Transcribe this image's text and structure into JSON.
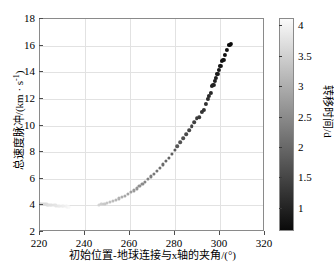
{
  "chart_data": {
    "type": "scatter",
    "title": "",
    "xlabel": "初始位置-地球连接与x轴的夹角/(°)",
    "ylabel": "总速度脉冲/(km·s⁻¹)",
    "xlim": [
      220,
      320
    ],
    "ylim": [
      2,
      18
    ],
    "xticks": [
      220,
      240,
      260,
      280,
      300,
      320
    ],
    "xticklabels": [
      "220",
      "240",
      "260",
      "280",
      "300",
      "320"
    ],
    "yticks": [
      2,
      4,
      6,
      8,
      10,
      12,
      14,
      16,
      18
    ],
    "yticklabels": [
      "2",
      "4",
      "6",
      "8",
      "10",
      "12",
      "14",
      "16",
      "18"
    ],
    "grid": true,
    "legend": null,
    "colorbar": {
      "label": "转移时间/d",
      "ticks": [
        1,
        1.5,
        2,
        2.5,
        3,
        3.5,
        4
      ],
      "ticklabels": [
        "1",
        "1.5",
        "2",
        "2.5",
        "3",
        "3.5",
        "4"
      ],
      "vmin": 0.62,
      "vmax": 4.12,
      "colormap": "gray",
      "low_color": "#0a0a0a",
      "high_color": "#fafafa"
    },
    "marker": "filled-circle",
    "colorvar": "转移时间/d",
    "series": [
      {
        "name": "左支 (220°-233°)",
        "x": [
          220.0,
          220.6,
          221.2,
          221.8,
          222.4,
          223.0,
          223.6,
          224.2,
          224.8,
          225.4,
          226.0,
          226.6,
          227.2,
          227.8,
          228.4,
          229.0,
          229.6,
          230.2,
          230.8,
          231.4,
          232.0,
          232.6,
          233.0
        ],
        "y": [
          4.12,
          4.11,
          4.1,
          4.09,
          4.08,
          4.07,
          4.06,
          4.05,
          4.04,
          4.03,
          4.02,
          4.01,
          4.0,
          3.99,
          3.98,
          3.97,
          3.96,
          3.95,
          3.94,
          3.93,
          3.92,
          3.91,
          3.9
        ],
        "c": [
          3.58,
          3.6,
          3.62,
          3.64,
          3.66,
          3.68,
          3.7,
          3.72,
          3.74,
          3.76,
          3.78,
          3.8,
          3.82,
          3.84,
          3.86,
          3.88,
          3.9,
          3.92,
          3.95,
          3.98,
          4.01,
          4.05,
          4.1
        ]
      },
      {
        "name": "右支 (246°-305°)",
        "x": [
          246.0,
          247.3,
          248.6,
          249.9,
          251.2,
          252.5,
          253.8,
          255.1,
          256.4,
          257.7,
          259.0,
          260.3,
          261.6,
          262.9,
          264.2,
          265.5,
          266.8,
          268.1,
          269.4,
          270.7,
          272.0,
          273.3,
          274.6,
          275.9,
          277.2,
          278.5,
          279.8,
          281.1,
          282.4,
          283.7,
          285.0,
          286.2,
          287.4,
          288.6,
          289.7,
          290.8,
          291.8,
          292.8,
          293.7,
          294.5,
          295.2,
          295.9,
          296.5,
          297.1,
          297.6,
          298.1,
          298.6,
          299.1,
          299.6,
          300.2,
          300.8,
          301.5,
          302.3,
          303.2,
          304.2,
          305.0
        ],
        "y": [
          4.05,
          4.09,
          4.14,
          4.2,
          4.27,
          4.35,
          4.44,
          4.53,
          4.63,
          4.74,
          4.86,
          4.99,
          5.13,
          5.28,
          5.44,
          5.61,
          5.79,
          5.98,
          6.18,
          6.39,
          6.61,
          6.84,
          7.08,
          7.33,
          7.59,
          7.86,
          8.14,
          8.43,
          8.73,
          9.04,
          9.36,
          9.66,
          9.96,
          10.25,
          10.55,
          10.62,
          11.05,
          11.18,
          11.62,
          12.0,
          12.22,
          12.45,
          13.0,
          13.05,
          13.35,
          13.6,
          13.85,
          13.88,
          14.2,
          14.5,
          14.85,
          14.9,
          15.3,
          15.7,
          16.05,
          16.1
        ],
        "c": [
          3.55,
          3.48,
          3.41,
          3.34,
          3.27,
          3.2,
          3.13,
          3.06,
          2.99,
          2.92,
          2.85,
          2.78,
          2.71,
          2.64,
          2.57,
          2.5,
          2.43,
          2.36,
          2.29,
          2.22,
          2.16,
          2.1,
          2.04,
          1.98,
          1.92,
          1.86,
          1.8,
          1.74,
          1.68,
          1.62,
          1.56,
          1.5,
          1.45,
          1.4,
          1.35,
          1.3,
          1.25,
          1.21,
          1.17,
          1.13,
          1.09,
          1.05,
          1.01,
          0.98,
          0.95,
          0.92,
          0.89,
          0.86,
          0.83,
          0.8,
          0.77,
          0.74,
          0.72,
          0.69,
          0.66,
          0.63
        ]
      }
    ]
  },
  "axes": {
    "x_title": "初始位置-地球连接与x轴的夹角/(°)",
    "y_title_main": "总速度脉冲/(km · s",
    "y_title_sup": "-1",
    "y_title_tail": ")"
  },
  "colorbar_ui": {
    "title": "转移时间/d"
  }
}
